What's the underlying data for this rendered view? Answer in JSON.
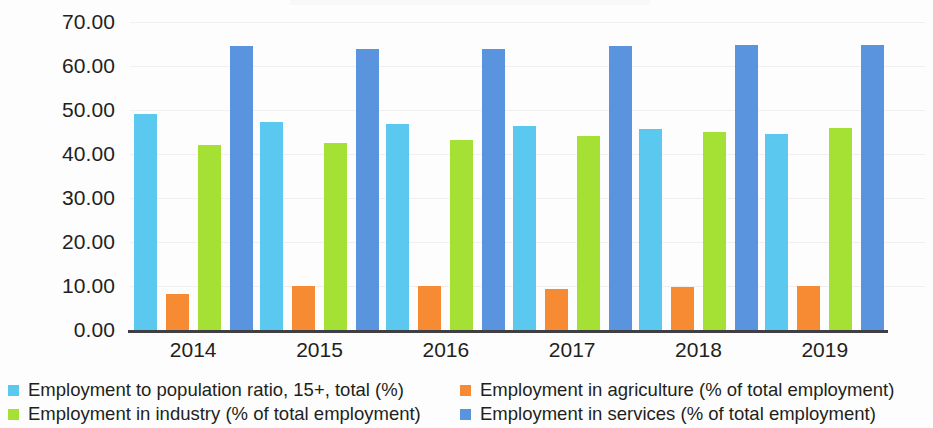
{
  "chart_data": {
    "type": "bar",
    "title": "",
    "subtitle": "",
    "xlabel": "",
    "ylabel": "",
    "grid": true,
    "legend_position": "bottom",
    "ylim": [
      0,
      70
    ],
    "yticks": [
      "0.00",
      "10.00",
      "20.00",
      "30.00",
      "40.00",
      "50.00",
      "60.00",
      "70.00"
    ],
    "ytick_values": [
      0,
      10,
      20,
      30,
      40,
      50,
      60,
      70
    ],
    "categories": [
      "2014",
      "2015",
      "2016",
      "2017",
      "2018",
      "2019"
    ],
    "series": [
      {
        "name": "Employment to population ratio, 15+, total (%)",
        "color": "#5BC8EF",
        "values": [
          49.1,
          47.2,
          46.8,
          46.4,
          45.6,
          44.6
        ]
      },
      {
        "name": "Employment in agriculture (% of total employment)",
        "color": "#F68B33",
        "values": [
          8.1,
          10.0,
          10.0,
          9.4,
          9.7,
          10.0
        ]
      },
      {
        "name": "Employment in industry (% of total employment)",
        "color": "#A5E035",
        "values": [
          42.1,
          42.5,
          43.1,
          44.1,
          45.0,
          45.9
        ]
      },
      {
        "name": "Employment in services (% of total employment)",
        "color": "#5A93DE",
        "values": [
          64.6,
          63.8,
          63.8,
          64.6,
          64.8,
          64.8
        ]
      }
    ]
  },
  "legend": {
    "items": [
      {
        "label": "Employment to population ratio, 15+, total (%)",
        "color": "#5BC8EF"
      },
      {
        "label": "Employment in agriculture (% of total employment)",
        "color": "#F68B33"
      },
      {
        "label": "Employment in industry (% of total employment)",
        "color": "#A5E035"
      },
      {
        "label": "Employment in services (% of total employment)",
        "color": "#5A93DE"
      }
    ]
  }
}
